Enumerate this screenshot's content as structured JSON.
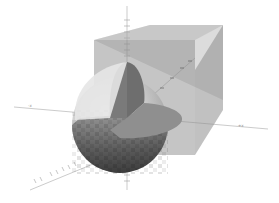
{
  "viewport": {
    "background": "#ffffff",
    "width": 279,
    "height": 203
  },
  "scene": {
    "objects": [
      {
        "name": "translucent-box",
        "color": "#8c8c8c",
        "opacity": 0.55
      },
      {
        "name": "sphere-with-cutout",
        "color": "#9a9a9a"
      }
    ],
    "axes": {
      "x_label_neg": "-x",
      "x_label_pos": "+x",
      "color": "#9a9a9a"
    }
  }
}
